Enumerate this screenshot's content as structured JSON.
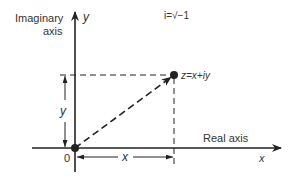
{
  "diagram": {
    "imaginary_axis_label_line1": "Imaginary",
    "imaginary_axis_label_line2": "axis",
    "imaginary_axis_var": "y",
    "real_axis_label": "Real axis",
    "real_axis_var": "x",
    "definition": "i=√−1",
    "point_label": "z=x+iy",
    "origin_label": "0",
    "x_dimension_label": "x",
    "y_dimension_label": "y",
    "colors": {
      "line": "#222222",
      "text": "#333333",
      "background": "#ffffff"
    }
  }
}
